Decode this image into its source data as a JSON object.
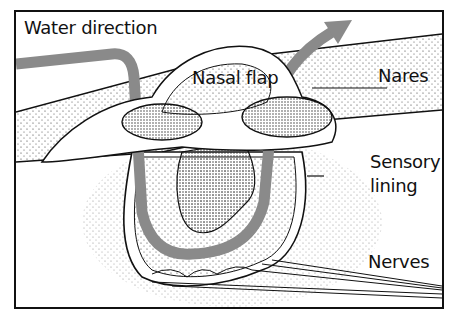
{
  "diagram": {
    "labels": {
      "water_direction": "Water direction",
      "nasal_flap": "Nasal flap",
      "nares": "Nares",
      "sensory_lining_line1": "Sensory",
      "sensory_lining_line2": "lining",
      "nerves": "Nerves"
    },
    "colors": {
      "outline": "#111111",
      "water_arrow": "#8a8a8a",
      "background": "#ffffff",
      "stipple": "#333333"
    }
  }
}
